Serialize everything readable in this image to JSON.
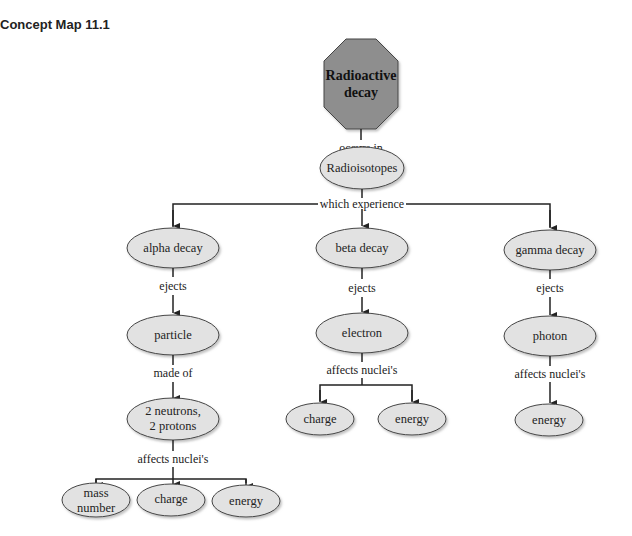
{
  "title": "Concept Map 11.1",
  "colors": {
    "root_fill": "#8e8e8e",
    "node_fill": "#e2e2e2",
    "line": "#222222"
  },
  "nodes": {
    "root": {
      "line1": "Radioactive",
      "line2": "decay"
    },
    "radioisotopes": "Radioisotopes",
    "alpha": "alpha decay",
    "beta": "beta decay",
    "gamma": "gamma decay",
    "particle": "particle",
    "electron": "electron",
    "photon": "photon",
    "neutrons": {
      "line1": "2 neutrons,",
      "line2": "2 protons"
    },
    "alpha_mass": {
      "line1": "mass",
      "line2": "number"
    },
    "alpha_charge": "charge",
    "alpha_energy": "energy",
    "beta_charge": "charge",
    "beta_energy": "energy",
    "gamma_energy": "energy"
  },
  "links": {
    "occurs_in": "occurs in",
    "which_experience": "which experience",
    "alpha_ejects": "ejects",
    "beta_ejects": "ejects",
    "gamma_ejects": "ejects",
    "made_of": "made of",
    "beta_affects": "affects nuclei's",
    "gamma_affects": "affects nuclei's",
    "alpha_affects": "affects nuclei's"
  }
}
